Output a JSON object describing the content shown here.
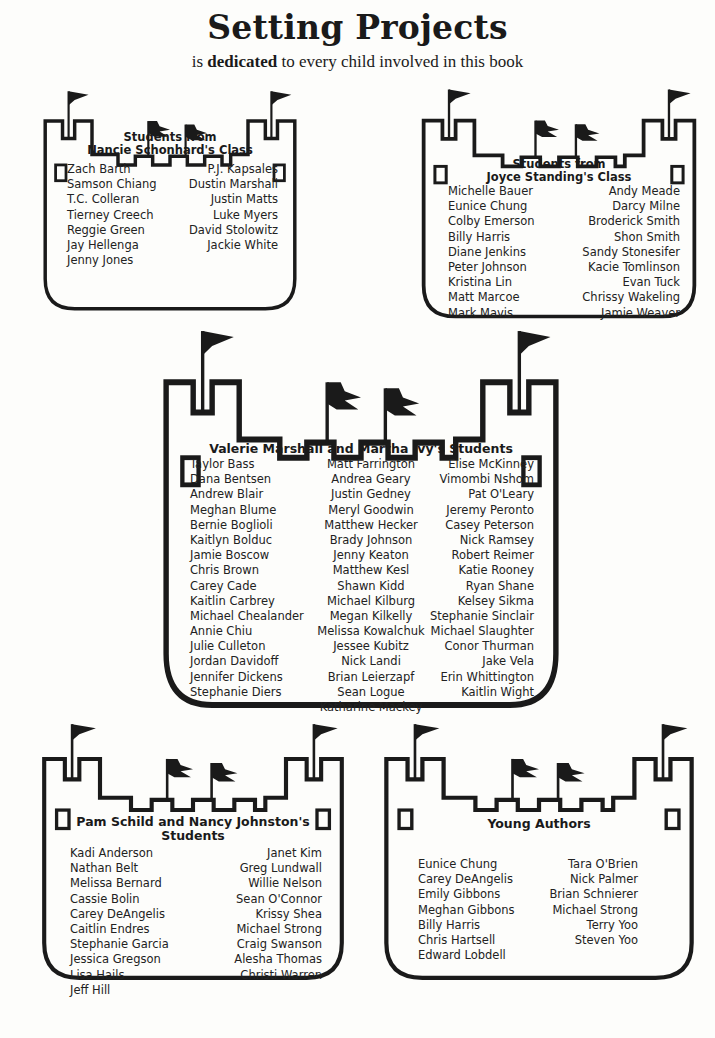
{
  "header": {
    "title": "Setting Projects",
    "subtitle_pre": "is ",
    "subtitle_bold": "dedicated",
    "subtitle_post": " to every child involved in this book"
  },
  "castles": {
    "nancie": {
      "heading_line1": "Students from",
      "heading_line2": "Nancie Schonhard's Class",
      "left": [
        "Zach Barth",
        "Samson Chiang",
        "T.C. Colleran",
        "Tierney Creech",
        "Reggie Green",
        "Jay Hellenga",
        "Jenny Jones"
      ],
      "right": [
        "P.J. Kapsales",
        "Dustin Marshall",
        "Justin Matts",
        "Luke Myers",
        "David Stolowitz",
        "Jackie White"
      ]
    },
    "joyce": {
      "heading_line1": "Students from",
      "heading_line2": "Joyce Standing's Class",
      "left": [
        "Michelle Bauer",
        "Eunice Chung",
        "Colby Emerson",
        "Billy Harris",
        "Diane Jenkins",
        "Peter Johnson",
        "Kristina Lin",
        "Matt Marcoe",
        "Mark Mavis"
      ],
      "right": [
        "Andy Meade",
        "Darcy Milne",
        "Broderick Smith",
        "Shon Smith",
        "Sandy Stonesifer",
        "Kacie Tomlinson",
        "Evan Tuck",
        "Chrissy Wakeling",
        "Jamie Weaver"
      ]
    },
    "valerie": {
      "heading": "Valerie Marshall and Martha Ivy's Students",
      "left": [
        "Taylor Bass",
        "Dana Bentsen",
        "Andrew Blair",
        "Meghan Blume",
        "Bernie Boglioli",
        "Kaitlyn Bolduc",
        "Jamie Boscow",
        "Chris Brown",
        "Carey Cade",
        "Kaitlin Carbrey",
        "Michael Chealander",
        "Annie Chiu",
        "Julie Culleton",
        "Jordan Davidoff",
        "Jennifer Dickens",
        "Stephanie Diers"
      ],
      "middle": [
        "Matt Farrington",
        "Andrea Geary",
        "Justin Gedney",
        "Meryl Goodwin",
        "Matthew Hecker",
        "Brady Johnson",
        "Jenny Keaton",
        "Matthew Kesl",
        "Shawn Kidd",
        "Michael Kilburg",
        "Megan Kilkelly",
        "Melissa Kowalchuk",
        "Jessee Kubitz",
        "Nick Landi",
        "Brian Leierzapf",
        "Sean Logue",
        "Katharine Mackey"
      ],
      "right": [
        "Elise McKinney",
        "Vimombi Nshom",
        "Pat O'Leary",
        "Jeremy Peronto",
        "Casey Peterson",
        "Nick Ramsey",
        "Robert Reimer",
        "Katie Rooney",
        "Ryan Shane",
        "Kelsey Sikma",
        "Stephanie Sinclair",
        "Michael Slaughter",
        "Conor Thurman",
        "Jake Vela",
        "Erin Whittington",
        "Kaitlin Wight"
      ]
    },
    "pam": {
      "heading_line1": "Pam Schild and Nancy Johnston's",
      "heading_line2": "Students",
      "left": [
        "Kadi Anderson",
        "Nathan Belt",
        "Melissa Bernard",
        "Cassie Bolin",
        "Carey DeAngelis",
        "Caitlin Endres",
        "Stephanie Garcia",
        "Jessica Gregson",
        "Lisa Hails",
        "Jeff Hill"
      ],
      "right": [
        "Janet Kim",
        "Greg Lundwall",
        "Willie Nelson",
        "Sean O'Connor",
        "Krissy Shea",
        "Michael Strong",
        "Craig Swanson",
        "Alesha Thomas",
        "Christi Warren"
      ]
    },
    "young": {
      "heading": "Young Authors",
      "left": [
        "Eunice Chung",
        "Carey DeAngelis",
        "Emily Gibbons",
        "Meghan Gibbons",
        "Billy Harris",
        "Chris Hartsell",
        "Edward Lobdell"
      ],
      "right": [
        "Tara O'Brien",
        "Nick Palmer",
        "Brian Schnierer",
        "Michael Strong",
        "Terry Yoo",
        "Steven Yoo"
      ]
    }
  },
  "colors": {
    "ink": "#1a1a1a",
    "paper": "#fdfdfb"
  }
}
